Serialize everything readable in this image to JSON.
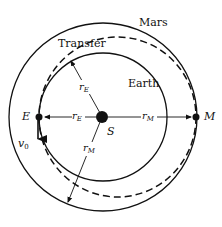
{
  "diagram": {
    "labels": {
      "mars": "Mars",
      "transfer": "Transfer",
      "earth": "Earth",
      "earth_point": "E",
      "mars_point": "M",
      "sun": "S",
      "velocity": "v",
      "velocity_sub": "0",
      "r_e": "r",
      "r_e_sub": "E",
      "r_m": "r",
      "r_m_sub": "M"
    },
    "geometry": {
      "sun_center": [
        102,
        117
      ],
      "earth_orbit_radius": 63,
      "mars_orbit_radius": 95,
      "transfer_ellipse": {
        "cx": 117.5,
        "cy": 117,
        "rx": 78.5,
        "ry": 80
      }
    },
    "colors": {
      "stroke": "#111111",
      "background": "#ffffff"
    }
  }
}
